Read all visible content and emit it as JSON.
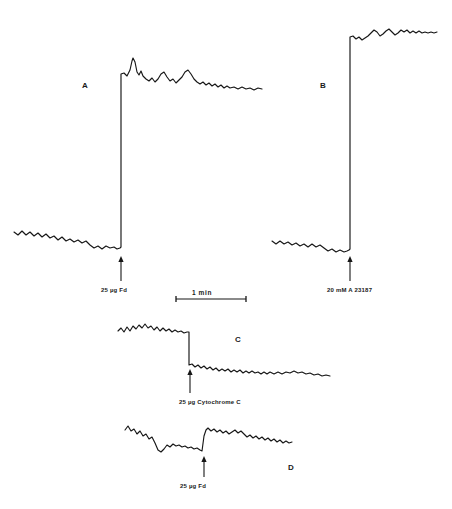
{
  "figure": {
    "background_color": "#ffffff",
    "ink_color": "#161616",
    "width": 452,
    "height": 509
  },
  "panels": [
    {
      "id": "A",
      "letter": "A",
      "letter_x": 82,
      "letter_y": 82,
      "event_label": "25 µg  Fd",
      "event_label_x": 101,
      "event_label_y": 287,
      "arrow_x": 121,
      "arrow_top_y": 256,
      "arrow_bottom_y": 281,
      "direction": "upward-deflection"
    },
    {
      "id": "B",
      "letter": "B",
      "letter_x": 320,
      "letter_y": 82,
      "event_label": "20 mM   A 23187",
      "event_label_x": 327,
      "event_label_y": 287,
      "arrow_x": 350,
      "arrow_top_y": 256,
      "arrow_bottom_y": 281,
      "direction": "upward-deflection"
    },
    {
      "id": "C",
      "letter": "C",
      "letter_x": 235,
      "letter_y": 336,
      "event_label": "25 µg  Cytochrome C",
      "event_label_x": 179,
      "event_label_y": 399,
      "arrow_x": 190,
      "arrow_top_y": 369,
      "arrow_bottom_y": 393,
      "direction": "downward-deflection"
    },
    {
      "id": "D",
      "letter": "D",
      "letter_x": 288,
      "letter_y": 464,
      "event_label": "25 µg   Fd",
      "event_label_x": 180,
      "event_label_y": 483,
      "arrow_x": 204,
      "arrow_top_y": 456,
      "arrow_bottom_y": 477,
      "direction": "upward-deflection"
    }
  ],
  "scale_bar": {
    "label": "1   min",
    "label_x": 192,
    "label_y": 290,
    "x_start": 176,
    "x_end": 246,
    "y": 299
  },
  "chart_data": {
    "type": "line",
    "xlabel": "time",
    "ylabel": "signal (arbitrary units, pen deflection)",
    "grid": false,
    "legend": "none",
    "axis_note": "No numeric axes drawn; horizontal scale given by 1 min bar, vertical scale arbitrary.",
    "series": [
      {
        "name": "A",
        "annotation": "25 µg Fd added at arrow; large upward deflection with overshoot then slow decay",
        "addition_x": 121,
        "baseline_mean_y": 240,
        "post_event_plateau_y": 88,
        "points": [
          [
            14,
            232
          ],
          [
            18,
            235
          ],
          [
            22,
            231
          ],
          [
            26,
            235
          ],
          [
            30,
            232
          ],
          [
            34,
            236
          ],
          [
            38,
            233
          ],
          [
            42,
            237
          ],
          [
            46,
            234
          ],
          [
            50,
            238
          ],
          [
            54,
            236
          ],
          [
            58,
            240
          ],
          [
            62,
            237
          ],
          [
            66,
            241
          ],
          [
            70,
            239
          ],
          [
            74,
            242
          ],
          [
            78,
            240
          ],
          [
            82,
            243
          ],
          [
            86,
            241
          ],
          [
            90,
            245
          ],
          [
            94,
            248
          ],
          [
            98,
            246
          ],
          [
            102,
            249
          ],
          [
            106,
            246
          ],
          [
            110,
            248
          ],
          [
            114,
            247
          ],
          [
            117,
            249
          ],
          [
            120,
            248
          ],
          [
            121,
            247
          ],
          [
            121,
            74
          ],
          [
            124,
            73
          ],
          [
            127,
            76
          ],
          [
            130,
            70
          ],
          [
            132,
            61
          ],
          [
            133,
            58
          ],
          [
            135,
            62
          ],
          [
            137,
            72
          ],
          [
            139,
            75
          ],
          [
            141,
            71
          ],
          [
            143,
            76
          ],
          [
            146,
            79
          ],
          [
            149,
            81
          ],
          [
            152,
            78
          ],
          [
            155,
            82
          ],
          [
            158,
            79
          ],
          [
            161,
            74
          ],
          [
            164,
            72
          ],
          [
            167,
            77
          ],
          [
            170,
            81
          ],
          [
            173,
            79
          ],
          [
            176,
            83
          ],
          [
            179,
            80
          ],
          [
            182,
            77
          ],
          [
            185,
            72
          ],
          [
            188,
            70
          ],
          [
            191,
            74
          ],
          [
            194,
            79
          ],
          [
            197,
            82
          ],
          [
            200,
            84
          ],
          [
            203,
            82
          ],
          [
            206,
            85
          ],
          [
            209,
            83
          ],
          [
            212,
            86
          ],
          [
            215,
            84
          ],
          [
            218,
            87
          ],
          [
            221,
            85
          ],
          [
            224,
            88
          ],
          [
            227,
            86
          ],
          [
            230,
            88
          ],
          [
            234,
            87
          ],
          [
            238,
            89
          ],
          [
            242,
            87
          ],
          [
            246,
            89
          ],
          [
            250,
            88
          ],
          [
            254,
            90
          ],
          [
            258,
            88
          ],
          [
            262,
            89
          ]
        ]
      },
      {
        "name": "B",
        "annotation": "20 mM A 23187 added at arrow; large rapid upward deflection to sustained plateau",
        "addition_x": 350,
        "baseline_mean_y": 242,
        "post_event_plateau_y": 34,
        "points": [
          [
            272,
            241
          ],
          [
            276,
            244
          ],
          [
            280,
            241
          ],
          [
            284,
            244
          ],
          [
            288,
            242
          ],
          [
            292,
            245
          ],
          [
            296,
            243
          ],
          [
            300,
            246
          ],
          [
            304,
            244
          ],
          [
            308,
            247
          ],
          [
            312,
            244
          ],
          [
            316,
            247
          ],
          [
            320,
            245
          ],
          [
            324,
            248
          ],
          [
            328,
            251
          ],
          [
            332,
            249
          ],
          [
            336,
            252
          ],
          [
            340,
            250
          ],
          [
            344,
            252
          ],
          [
            347,
            251
          ],
          [
            349,
            250
          ],
          [
            350,
            249
          ],
          [
            350,
            37
          ],
          [
            353,
            36
          ],
          [
            356,
            39
          ],
          [
            359,
            37
          ],
          [
            362,
            40
          ],
          [
            365,
            38
          ],
          [
            368,
            36
          ],
          [
            371,
            33
          ],
          [
            374,
            30
          ],
          [
            377,
            32
          ],
          [
            380,
            36
          ],
          [
            383,
            34
          ],
          [
            386,
            31
          ],
          [
            389,
            29
          ],
          [
            392,
            32
          ],
          [
            395,
            35
          ],
          [
            398,
            33
          ],
          [
            401,
            30
          ],
          [
            404,
            32
          ],
          [
            407,
            30
          ],
          [
            410,
            33
          ],
          [
            413,
            31
          ],
          [
            416,
            33
          ],
          [
            419,
            31
          ],
          [
            422,
            33
          ],
          [
            425,
            32
          ],
          [
            428,
            33
          ],
          [
            431,
            32
          ],
          [
            434,
            33
          ],
          [
            437,
            32
          ]
        ]
      },
      {
        "name": "C",
        "annotation": "25 µg Cytochrome C added at arrow; sharp downward deflection then slow drift down",
        "addition_x": 189,
        "baseline_mean_y": 330,
        "post_event_plateau_y": 368,
        "points": [
          [
            118,
            331
          ],
          [
            121,
            328
          ],
          [
            124,
            332
          ],
          [
            127,
            327
          ],
          [
            130,
            331
          ],
          [
            133,
            326
          ],
          [
            136,
            329
          ],
          [
            139,
            325
          ],
          [
            142,
            328
          ],
          [
            145,
            324
          ],
          [
            148,
            328
          ],
          [
            151,
            326
          ],
          [
            154,
            330
          ],
          [
            157,
            327
          ],
          [
            160,
            331
          ],
          [
            163,
            328
          ],
          [
            166,
            331
          ],
          [
            169,
            329
          ],
          [
            172,
            332
          ],
          [
            175,
            330
          ],
          [
            178,
            332
          ],
          [
            181,
            331
          ],
          [
            184,
            333
          ],
          [
            187,
            332
          ],
          [
            189,
            332
          ],
          [
            189,
            365
          ],
          [
            192,
            364
          ],
          [
            195,
            367
          ],
          [
            198,
            365
          ],
          [
            201,
            368
          ],
          [
            204,
            366
          ],
          [
            207,
            369
          ],
          [
            210,
            367
          ],
          [
            213,
            370
          ],
          [
            216,
            368
          ],
          [
            219,
            371
          ],
          [
            222,
            369
          ],
          [
            225,
            371
          ],
          [
            228,
            369
          ],
          [
            231,
            372
          ],
          [
            234,
            370
          ],
          [
            237,
            372
          ],
          [
            240,
            370
          ],
          [
            243,
            373
          ],
          [
            246,
            371
          ],
          [
            249,
            373
          ],
          [
            252,
            371
          ],
          [
            255,
            373
          ],
          [
            258,
            372
          ],
          [
            261,
            374
          ],
          [
            264,
            372
          ],
          [
            267,
            374
          ],
          [
            270,
            372
          ],
          [
            274,
            374
          ],
          [
            278,
            372
          ],
          [
            282,
            374
          ],
          [
            286,
            372
          ],
          [
            290,
            373
          ],
          [
            294,
            371
          ],
          [
            298,
            373
          ],
          [
            302,
            372
          ],
          [
            306,
            374
          ],
          [
            310,
            373
          ],
          [
            314,
            375
          ],
          [
            318,
            374
          ],
          [
            322,
            376
          ],
          [
            326,
            375
          ],
          [
            330,
            376
          ]
        ]
      },
      {
        "name": "D",
        "annotation": "25 µg Fd added at arrow; small upward step followed by slow downward drift",
        "addition_x": 203,
        "baseline_mean_y": 447,
        "post_event_plateau_y": 434,
        "points": [
          [
            125,
            430
          ],
          [
            128,
            426
          ],
          [
            131,
            431
          ],
          [
            134,
            429
          ],
          [
            137,
            434
          ],
          [
            140,
            431
          ],
          [
            143,
            436
          ],
          [
            146,
            434
          ],
          [
            149,
            439
          ],
          [
            152,
            437
          ],
          [
            155,
            443
          ],
          [
            158,
            450
          ],
          [
            161,
            452
          ],
          [
            164,
            449
          ],
          [
            167,
            445
          ],
          [
            170,
            447
          ],
          [
            173,
            444
          ],
          [
            176,
            446
          ],
          [
            179,
            445
          ],
          [
            182,
            447
          ],
          [
            185,
            446
          ],
          [
            188,
            448
          ],
          [
            191,
            447
          ],
          [
            194,
            449
          ],
          [
            197,
            448
          ],
          [
            200,
            450
          ],
          [
            202,
            451
          ],
          [
            204,
            436
          ],
          [
            206,
            430
          ],
          [
            208,
            428
          ],
          [
            211,
            431
          ],
          [
            214,
            429
          ],
          [
            217,
            432
          ],
          [
            220,
            430
          ],
          [
            223,
            433
          ],
          [
            226,
            431
          ],
          [
            229,
            434
          ],
          [
            232,
            432
          ],
          [
            235,
            430
          ],
          [
            238,
            433
          ],
          [
            241,
            431
          ],
          [
            244,
            434
          ],
          [
            247,
            437
          ],
          [
            250,
            435
          ],
          [
            253,
            438
          ],
          [
            256,
            436
          ],
          [
            259,
            439
          ],
          [
            262,
            437
          ],
          [
            265,
            440
          ],
          [
            268,
            438
          ],
          [
            271,
            441
          ],
          [
            274,
            439
          ],
          [
            277,
            442
          ],
          [
            280,
            440
          ],
          [
            283,
            443
          ],
          [
            286,
            441
          ],
          [
            289,
            443
          ],
          [
            292,
            442
          ]
        ]
      }
    ]
  }
}
